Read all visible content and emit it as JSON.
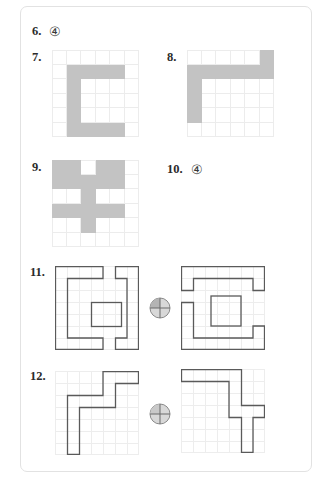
{
  "page": {
    "background_color": "#ffffff",
    "border_color": "#e2e2e2",
    "fill_color": "#c3c3c3",
    "grid_line_color": "#ececec",
    "outline_color": "#5a5a5a"
  },
  "problems": [
    {
      "id": "6",
      "number_label": "6.",
      "type": "answer-only",
      "answer_label": "④",
      "answer_value": 4
    },
    {
      "id": "7",
      "number_label": "7.",
      "type": "pixel-grid",
      "grid": {
        "cols": 6,
        "rows": 6
      },
      "filled_cells": [
        [
          1,
          1
        ],
        [
          2,
          1
        ],
        [
          3,
          1
        ],
        [
          4,
          1
        ],
        [
          1,
          2
        ],
        [
          1,
          3
        ],
        [
          1,
          4
        ],
        [
          1,
          5
        ],
        [
          2,
          5
        ],
        [
          3,
          5
        ],
        [
          4,
          5
        ]
      ]
    },
    {
      "id": "8",
      "number_label": "8.",
      "type": "pixel-grid",
      "grid": {
        "cols": 6,
        "rows": 6
      },
      "filled_cells": [
        [
          5,
          0
        ],
        [
          0,
          1
        ],
        [
          1,
          1
        ],
        [
          2,
          1
        ],
        [
          3,
          1
        ],
        [
          4,
          1
        ],
        [
          5,
          1
        ],
        [
          0,
          2
        ],
        [
          0,
          3
        ],
        [
          0,
          4
        ]
      ]
    },
    {
      "id": "9",
      "number_label": "9.",
      "type": "pixel-grid",
      "grid": {
        "cols": 6,
        "rows": 6
      },
      "filled_cells": [
        [
          0,
          0
        ],
        [
          1,
          0
        ],
        [
          3,
          0
        ],
        [
          4,
          0
        ],
        [
          0,
          1
        ],
        [
          1,
          1
        ],
        [
          2,
          1
        ],
        [
          3,
          1
        ],
        [
          4,
          1
        ],
        [
          2,
          2
        ],
        [
          0,
          3
        ],
        [
          1,
          3
        ],
        [
          2,
          3
        ],
        [
          3,
          3
        ],
        [
          4,
          3
        ],
        [
          2,
          4
        ]
      ]
    },
    {
      "id": "10",
      "number_label": "10.",
      "type": "answer-only",
      "answer_label": "④",
      "answer_value": 4
    },
    {
      "id": "11",
      "number_label": "11.",
      "type": "rotation-pair",
      "grid": {
        "cols": 7,
        "rows": 7
      },
      "rotation_icon": "quarter-turn-pie",
      "left_shape_path": "M 1 0 L 4 0 L 4 1 L 1 1 L 1 2 L 5 2 L 5 0 L 7 0 L 7 7 L 5 7 L 5 5 L 1 5 L 1 6 L 4 6 L 4 7 L 1 7 Z M 3 3 L 5 3 L 5 4 L 3 4 Z",
      "right_shape_path": "M 0 1 L 1 1 L 1 2 L 0 2 Z"
    },
    {
      "id": "12",
      "number_label": "12.",
      "type": "rotation-pair",
      "grid": {
        "cols": 7,
        "rows": 7
      },
      "rotation_icon": "quarter-turn-pie",
      "left_shape_path": "M 0 0",
      "right_shape_path": "M 0 0"
    }
  ]
}
